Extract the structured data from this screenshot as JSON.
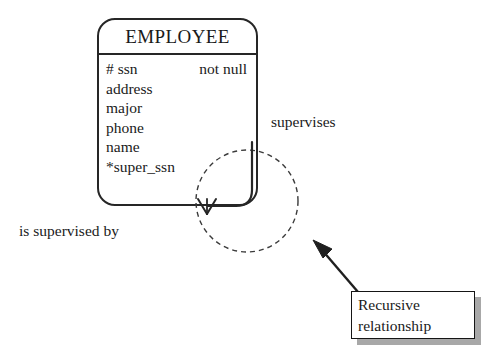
{
  "diagram": {
    "type": "entity-relationship-diagram",
    "background_color": "#ffffff",
    "line_color": "#262626",
    "entity": {
      "name": "EMPLOYEE",
      "attributes": [
        {
          "name": "# ssn",
          "note": "not null"
        },
        {
          "name": "address",
          "note": ""
        },
        {
          "name": "major",
          "note": ""
        },
        {
          "name": "phone",
          "note": ""
        },
        {
          "name": "name",
          "note": ""
        },
        {
          "name": "*super_ssn",
          "note": ""
        }
      ]
    },
    "relationship": {
      "shape": "dashed-circle",
      "labels": {
        "upper": "supervises",
        "lower": "is supervised by"
      }
    },
    "callout": {
      "line1": "Recursive",
      "line2": "relationship",
      "shadow_color": "#a8a8a8",
      "border_color": "#151515"
    }
  }
}
